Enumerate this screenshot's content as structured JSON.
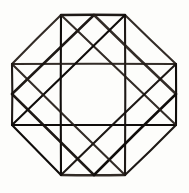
{
  "figure": {
    "background_color": "#fdfdfb",
    "ink_color": "#1a1714",
    "canvas": {
      "width": 189,
      "height": 193
    }
  },
  "geometry": {
    "octagon": {
      "name": "outer-octagon",
      "sides": 8,
      "vertices": [
        {
          "id": "oct-top-left",
          "x": 61,
          "y": 15
        },
        {
          "id": "oct-top-right",
          "x": 125,
          "y": 15
        },
        {
          "id": "oct-right-top",
          "x": 176,
          "y": 64
        },
        {
          "id": "oct-right-bottom",
          "x": 176,
          "y": 125
        },
        {
          "id": "oct-bottom-right",
          "x": 125,
          "y": 175
        },
        {
          "id": "oct-bottom-left",
          "x": 61,
          "y": 175
        },
        {
          "id": "oct-left-bottom",
          "x": 12,
          "y": 125
        },
        {
          "id": "oct-left-top",
          "x": 12,
          "y": 64
        }
      ]
    },
    "inner_square": {
      "name": "inscribed-square",
      "vertices": [
        {
          "id": "sq-top-left",
          "x": 61,
          "y": 15
        },
        {
          "id": "sq-top-right",
          "x": 125,
          "y": 15
        },
        {
          "id": "sq-bottom-right",
          "x": 125,
          "y": 175
        },
        {
          "id": "sq-bottom-left",
          "x": 61,
          "y": 175
        }
      ]
    },
    "cross_square": {
      "name": "cross-square",
      "vertices": [
        {
          "id": "cs-left-top",
          "x": 12,
          "y": 64
        },
        {
          "id": "cs-right-top",
          "x": 176,
          "y": 64
        },
        {
          "id": "cs-right-bottom",
          "x": 176,
          "y": 125
        },
        {
          "id": "cs-left-bottom",
          "x": 12,
          "y": 125
        }
      ]
    },
    "diamond": {
      "name": "rotated-square-diamond",
      "vertices": [
        {
          "id": "dia-top",
          "x": 94,
          "y": 15
        },
        {
          "id": "dia-right",
          "x": 176,
          "y": 94
        },
        {
          "id": "dia-bottom",
          "x": 94,
          "y": 175
        },
        {
          "id": "dia-left",
          "x": 12,
          "y": 94
        }
      ]
    },
    "segments": [
      {
        "id": "oct-edge-top",
        "label": "octagon-edge-top",
        "x1": 61,
        "y1": 15,
        "x2": 125,
        "y2": 15,
        "weight": "thick"
      },
      {
        "id": "oct-edge-upper-right",
        "label": "octagon-edge-upper-right",
        "x1": 125,
        "y1": 15,
        "x2": 176,
        "y2": 64,
        "weight": "normal"
      },
      {
        "id": "oct-edge-right",
        "label": "octagon-edge-right",
        "x1": 176,
        "y1": 64,
        "x2": 176,
        "y2": 125,
        "weight": "normal"
      },
      {
        "id": "oct-edge-lower-right",
        "label": "octagon-edge-lower-right",
        "x1": 176,
        "y1": 125,
        "x2": 125,
        "y2": 175,
        "weight": "normal"
      },
      {
        "id": "oct-edge-bottom",
        "label": "octagon-edge-bottom",
        "x1": 125,
        "y1": 175,
        "x2": 61,
        "y2": 175,
        "weight": "thick"
      },
      {
        "id": "oct-edge-lower-left",
        "label": "octagon-edge-lower-left",
        "x1": 61,
        "y1": 175,
        "x2": 12,
        "y2": 125,
        "weight": "normal"
      },
      {
        "id": "oct-edge-left",
        "label": "octagon-edge-left",
        "x1": 12,
        "y1": 125,
        "x2": 12,
        "y2": 64,
        "weight": "normal"
      },
      {
        "id": "oct-edge-upper-left",
        "label": "octagon-edge-upper-left",
        "x1": 12,
        "y1": 64,
        "x2": 61,
        "y2": 15,
        "weight": "normal"
      },
      {
        "id": "sq-edge-left",
        "label": "square-edge-left-vertical",
        "x1": 61,
        "y1": 15,
        "x2": 61,
        "y2": 175,
        "weight": "normal"
      },
      {
        "id": "sq-edge-right",
        "label": "square-edge-right-vertical",
        "x1": 125,
        "y1": 15,
        "x2": 125,
        "y2": 175,
        "weight": "normal"
      },
      {
        "id": "cs-edge-top",
        "label": "cross-square-edge-top",
        "x1": 12,
        "y1": 64,
        "x2": 176,
        "y2": 64,
        "weight": "normal"
      },
      {
        "id": "cs-edge-bottom",
        "label": "cross-square-edge-bottom",
        "x1": 12,
        "y1": 125,
        "x2": 176,
        "y2": 125,
        "weight": "normal"
      },
      {
        "id": "dia-edge-top-left",
        "label": "diamond-edge-top-left",
        "x1": 94,
        "y1": 15,
        "x2": 12,
        "y2": 94,
        "weight": "thick"
      },
      {
        "id": "dia-edge-top-right",
        "label": "diamond-edge-top-right",
        "x1": 94,
        "y1": 15,
        "x2": 176,
        "y2": 94,
        "weight": "thick"
      },
      {
        "id": "dia-edge-bottom-right",
        "label": "diamond-edge-bottom-right",
        "x1": 176,
        "y1": 94,
        "x2": 94,
        "y2": 175,
        "weight": "thick"
      },
      {
        "id": "dia-edge-bottom-left",
        "label": "diamond-edge-bottom-left",
        "x1": 94,
        "y1": 175,
        "x2": 12,
        "y2": 94,
        "weight": "thick"
      },
      {
        "id": "diag-tl-br",
        "label": "square-diagonal-tl-br",
        "x1": 61,
        "y1": 15,
        "x2": 176,
        "y2": 125,
        "weight": "normal"
      },
      {
        "id": "diag-tr-bl",
        "label": "square-diagonal-tr-bl",
        "x1": 125,
        "y1": 15,
        "x2": 12,
        "y2": 125,
        "weight": "normal"
      },
      {
        "id": "diag-bl-tr",
        "label": "square-diagonal-bl-tr",
        "x1": 61,
        "y1": 175,
        "x2": 176,
        "y2": 64,
        "weight": "normal"
      },
      {
        "id": "diag-br-tl",
        "label": "square-diagonal-br-tl",
        "x1": 125,
        "y1": 175,
        "x2": 12,
        "y2": 64,
        "weight": "normal"
      }
    ]
  }
}
